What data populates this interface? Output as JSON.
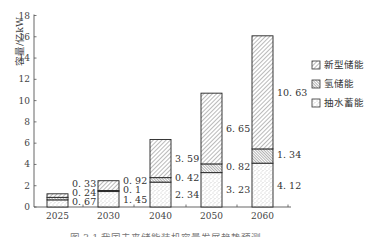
{
  "chart_data": {
    "type": "bar",
    "stacked": true,
    "title": "",
    "caption": "图 3-1  我国未来储能装机容量发展趋势预测",
    "xlabel": "",
    "ylabel": "容量/亿kW",
    "ylim": [
      0,
      18
    ],
    "yticks": [
      0,
      2,
      4,
      6,
      8,
      10,
      12,
      14,
      16,
      18
    ],
    "grid": false,
    "legend_position": "right",
    "categories": [
      "2025",
      "2030",
      "2040",
      "2050",
      "2060"
    ],
    "series": [
      {
        "name": "抽水蓄能",
        "pattern": "dots",
        "values": [
          0.67,
          1.45,
          2.34,
          3.23,
          4.12
        ],
        "labels": [
          "0.67",
          "1.45",
          "2.34",
          "3.23",
          "4.12"
        ]
      },
      {
        "name": "氢储能",
        "pattern": "dense-hatch",
        "values": [
          0.24,
          0.1,
          0.42,
          0.82,
          1.34
        ],
        "labels": [
          "0.24",
          "0.1",
          "0.42",
          "0.82",
          "1.34"
        ]
      },
      {
        "name": "新型储能",
        "pattern": "hatch",
        "values": [
          0.33,
          0.92,
          3.59,
          6.65,
          10.63
        ],
        "labels": [
          "0.33",
          "0.92",
          "3.59",
          "6.65",
          "10.63"
        ]
      }
    ],
    "legend": [
      "新型储能",
      "氢储能",
      "抽水蓄能"
    ]
  }
}
